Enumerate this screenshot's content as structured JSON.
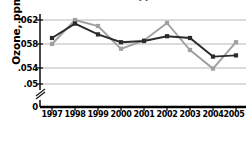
{
  "chart_data": {
    "type": "line",
    "title": "(as ozone, ppm)",
    "xlabel": "Year",
    "ylabel": "Ozone, ppm",
    "categories": [
      "1997",
      "1998",
      "1999",
      "2000",
      "2001",
      "2002",
      "2003",
      "2004",
      "2005"
    ],
    "series": [
      {
        "name": "series-dark",
        "color": "#2b2b2b",
        "marker": "square",
        "values": [
          0.059,
          0.0614,
          0.0596,
          0.0583,
          0.0585,
          0.0593,
          0.059,
          0.0559,
          0.0561
        ]
      },
      {
        "name": "series-gray",
        "color": "#a0a0a0",
        "marker": "square",
        "values": [
          0.058,
          0.062,
          0.061,
          0.0572,
          0.0586,
          0.0615,
          0.057,
          0.0539,
          0.0583
        ]
      }
    ],
    "ytick_labels": [
      ".062",
      ".058",
      ".054",
      ".05",
      "0"
    ],
    "ytick_values": [
      0.062,
      0.058,
      0.054,
      0.05,
      0
    ],
    "ylim": [
      0.05,
      0.0632
    ],
    "grid": true,
    "axis_break": true,
    "legend": "none"
  },
  "axis": {
    "break_symbol": "axis-break-slash"
  }
}
